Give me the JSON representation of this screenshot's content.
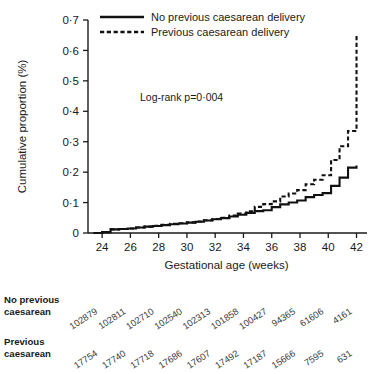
{
  "chart_data": {
    "type": "line",
    "title": "",
    "xlabel": "Gestational age (weeks)",
    "ylabel": "Cumulative proportion (%)",
    "xlim": [
      23,
      42.6
    ],
    "ylim": [
      0,
      0.7
    ],
    "xticks": [
      24,
      26,
      28,
      30,
      32,
      34,
      36,
      38,
      40,
      42
    ],
    "xticklabels": [
      "24",
      "26",
      "28",
      "30",
      "32",
      "34",
      "36",
      "38",
      "40",
      "42"
    ],
    "yticks": [
      0,
      0.1,
      0.2,
      0.3,
      0.4,
      0.5,
      0.6,
      0.7
    ],
    "yticklabels": [
      "0",
      "0·1",
      "0·2",
      "0·3",
      "0·4",
      "0·5",
      "0·6",
      "0·7"
    ],
    "grid": false,
    "legend_position": "top-center",
    "annotation": "Log-rank p=0·004",
    "curve_style": "step-post",
    "series": [
      {
        "name": "No previous caesarean delivery",
        "style": "solid",
        "x": [
          23.4,
          24.0,
          24.6,
          25.2,
          25.8,
          26.4,
          27.0,
          27.6,
          28.2,
          28.8,
          29.4,
          30.0,
          30.6,
          31.2,
          31.8,
          32.4,
          33.0,
          33.6,
          34.2,
          34.8,
          35.4,
          36.0,
          36.6,
          37.2,
          37.8,
          38.4,
          39.0,
          39.6,
          40.2,
          40.8,
          41.4,
          42.0
        ],
        "y": [
          0.0,
          0.003,
          0.012,
          0.013,
          0.015,
          0.018,
          0.021,
          0.023,
          0.026,
          0.029,
          0.031,
          0.034,
          0.037,
          0.041,
          0.045,
          0.049,
          0.054,
          0.06,
          0.066,
          0.072,
          0.075,
          0.085,
          0.094,
          0.1,
          0.107,
          0.118,
          0.125,
          0.131,
          0.155,
          0.182,
          0.215,
          0.222
        ]
      },
      {
        "name": "Previous caesarean delivery",
        "style": "dashed",
        "x": [
          23.4,
          24.0,
          24.6,
          25.2,
          25.8,
          26.4,
          27.0,
          27.6,
          28.2,
          28.8,
          29.4,
          30.0,
          30.6,
          31.2,
          31.8,
          32.4,
          33.0,
          33.6,
          34.2,
          34.8,
          35.4,
          36.0,
          36.6,
          37.2,
          37.8,
          38.4,
          39.0,
          39.6,
          40.2,
          40.8,
          41.4,
          42.0
        ],
        "y": [
          0.0,
          0.003,
          0.012,
          0.013,
          0.015,
          0.018,
          0.021,
          0.024,
          0.027,
          0.03,
          0.032,
          0.035,
          0.038,
          0.042,
          0.046,
          0.05,
          0.057,
          0.064,
          0.071,
          0.086,
          0.095,
          0.104,
          0.12,
          0.13,
          0.141,
          0.16,
          0.175,
          0.19,
          0.24,
          0.285,
          0.335,
          0.65
        ]
      }
    ]
  },
  "legend": {
    "items": [
      {
        "label": "No previous caesarean delivery",
        "style": "solid"
      },
      {
        "label": "Previous caesarean delivery",
        "style": "dashed"
      }
    ]
  },
  "risk_table": {
    "rows": [
      {
        "label_line1": "No previous",
        "label_line2": "caesarean",
        "values": [
          "102879",
          "102811",
          "102710",
          "102540",
          "102313",
          "101858",
          "100427",
          "94365",
          "61606",
          "4161"
        ]
      },
      {
        "label_line1": "Previous",
        "label_line2": "caesarean",
        "values": [
          "17754",
          "17740",
          "17718",
          "17686",
          "17607",
          "17492",
          "17187",
          "15666",
          "7595",
          "631"
        ]
      }
    ]
  }
}
